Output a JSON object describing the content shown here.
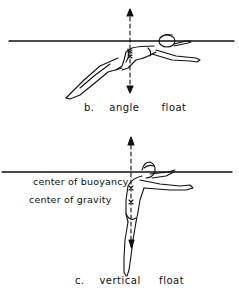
{
  "figures": [
    {
      "id": "b",
      "caption_letter": "b.",
      "caption_word1": "angle",
      "caption_word2": "float"
    },
    {
      "id": "c",
      "caption_letter": "c.",
      "caption_word1": "vertical",
      "caption_word2": "float",
      "labels": {
        "buoyancy": "center of buoyancy",
        "gravity": "center of gravity"
      }
    }
  ],
  "colors": {
    "ink": "#111111",
    "background": "#ffffff"
  }
}
